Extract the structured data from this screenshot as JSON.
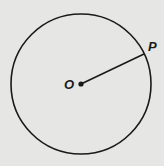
{
  "diagram": {
    "type": "circle-with-radius",
    "center": {
      "label": "O",
      "x": 81,
      "y": 84
    },
    "radius": 70,
    "point": {
      "label": "P",
      "x": 144,
      "y": 54
    },
    "colors": {
      "background": "#e6e6e4",
      "stroke": "#1a1a1a"
    }
  }
}
